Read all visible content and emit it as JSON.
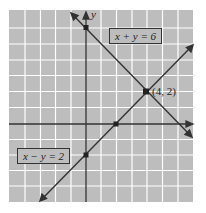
{
  "diagram": {
    "type": "coordinate-graph",
    "axes": {
      "x_label": "",
      "y_label": "y"
    },
    "grid": {
      "on": true,
      "x_range": [
        -5,
        7
      ],
      "y_range": [
        -5,
        7
      ]
    },
    "colors": {
      "grid_bg": "#bdbdbd",
      "grid_line": "#ffffff",
      "line": "#333333",
      "label_box": "#bdbdbd"
    },
    "lines": [
      {
        "equation": "x + y = 6",
        "label": "x + y = 6"
      },
      {
        "equation": "x − y = 2",
        "label": "x − y = 2"
      }
    ],
    "points": [
      {
        "x": 4,
        "y": 2,
        "label": "(4, 2)"
      },
      {
        "x": 0,
        "y": 6,
        "label": ""
      },
      {
        "x": 2,
        "y": 0,
        "label": ""
      },
      {
        "x": 0,
        "y": -2,
        "label": ""
      }
    ]
  }
}
